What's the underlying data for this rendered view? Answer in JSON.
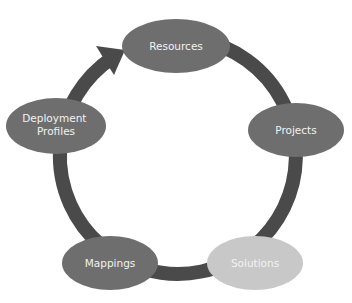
{
  "diagram": {
    "type": "cycle",
    "direction": "clockwise",
    "colors": {
      "ring": "#4a4a4a",
      "node_dark": "#6e6e6e",
      "node_light": "#c8c8c8",
      "label": "#f2f2f2",
      "background": "#ffffff"
    },
    "nodes": [
      {
        "id": "resources",
        "label": "Resources"
      },
      {
        "id": "projects",
        "label": "Projects"
      },
      {
        "id": "solutions",
        "label": "Solutions"
      },
      {
        "id": "mappings",
        "label": "Mappings"
      },
      {
        "id": "deployment-profiles",
        "label_line1": "Deployment",
        "label_line2": "Profiles"
      }
    ],
    "edges": [
      {
        "from": "resources",
        "to": "projects"
      },
      {
        "from": "projects",
        "to": "solutions"
      },
      {
        "from": "solutions",
        "to": "mappings"
      },
      {
        "from": "mappings",
        "to": "deployment-profiles"
      },
      {
        "from": "deployment-profiles",
        "to": "resources",
        "arrowhead": true
      }
    ]
  }
}
